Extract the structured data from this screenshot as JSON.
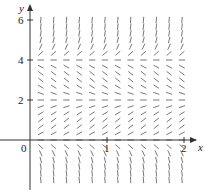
{
  "figure": {
    "type": "slope_field",
    "equation_hint": "dy/dx = y(y-2)(y-4)",
    "x_axis": {
      "label": "x",
      "ticks": [
        {
          "value": 0,
          "label": "0"
        },
        {
          "value": 1,
          "label": "1"
        },
        {
          "value": 2,
          "label": "2"
        }
      ]
    },
    "y_axis": {
      "label": "y",
      "ticks": [
        {
          "value": 2,
          "label": "2"
        },
        {
          "value": 4,
          "label": "4"
        },
        {
          "value": 6,
          "label": "6"
        }
      ]
    },
    "equilibria": [
      0,
      2,
      4
    ],
    "grid": {
      "x_start": 0.14,
      "x_step": 0.1667,
      "x_count": 12,
      "y_start": -2.0,
      "y_step": 0.3333,
      "y_count": 25
    },
    "colors": {
      "axis": "#333333",
      "segment": "#555555",
      "text": "#222222"
    }
  },
  "chart_data": {
    "type": "scatter",
    "title": "",
    "xlabel": "x",
    "ylabel": "y",
    "xlim": [
      -0.35,
      2.2
    ],
    "ylim": [
      -2.6,
      6.9
    ],
    "x_ticks": [
      0,
      1,
      2
    ],
    "y_ticks": [
      2,
      4,
      6
    ]
  }
}
